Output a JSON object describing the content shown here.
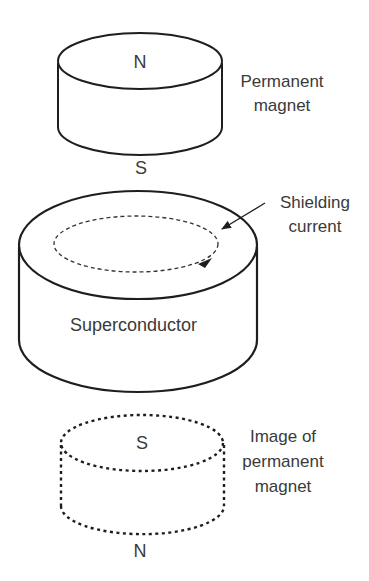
{
  "diagram": {
    "colors": {
      "stroke": "#1e1e1e",
      "text": "#3a3a3a",
      "background": "#ffffff"
    },
    "permanent_magnet": {
      "top_pole": "N",
      "bottom_pole": "S",
      "label_line1": "Permanent",
      "label_line2": "magnet"
    },
    "superconductor": {
      "label": "Superconductor",
      "current_label_line1": "Shielding",
      "current_label_line2": "current"
    },
    "image_magnet": {
      "top_pole": "S",
      "bottom_pole": "N",
      "label_line1": "Image of",
      "label_line2": "permanent",
      "label_line3": "magnet"
    }
  }
}
